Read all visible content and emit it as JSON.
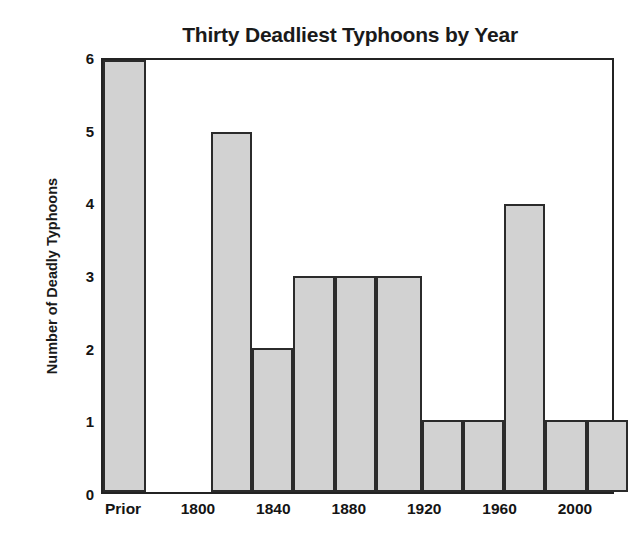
{
  "chart_data": {
    "type": "bar",
    "title": "Thirty Deadliest Typhoons by Year",
    "xlabel": "",
    "ylabel": "Number of Deadly Typhoons",
    "categories": [
      "Prior",
      "1800",
      "1820",
      "1840",
      "1860",
      "1880",
      "1900",
      "1920",
      "1940",
      "1960",
      "1980",
      "2000"
    ],
    "values": [
      6,
      0,
      5,
      2,
      3,
      3,
      3,
      1,
      1,
      4,
      1,
      1
    ],
    "ylim": [
      0,
      6
    ],
    "yticks": [
      "0",
      "1",
      "2",
      "3",
      "4",
      "5",
      "6"
    ],
    "xticks": [
      "Prior",
      "1800",
      "1840",
      "1880",
      "1920",
      "1960",
      "2000"
    ],
    "grid": false,
    "legend": "none",
    "bar_fill_color": "#d2d2d2",
    "bar_edge_color": "#2b2b2b",
    "axis_color": "#232323",
    "text_color": "#141414",
    "background_color": "#ffffff"
  },
  "axes": {
    "y_ticks": [
      {
        "label": "6",
        "value": 6
      },
      {
        "label": "5",
        "value": 5
      },
      {
        "label": "4",
        "value": 4
      },
      {
        "label": "3",
        "value": 3
      },
      {
        "label": "2",
        "value": 2
      },
      {
        "label": "1",
        "value": 1
      },
      {
        "label": "0",
        "value": 0
      }
    ],
    "x_ticks": [
      {
        "label": "Prior",
        "center_pct": 4.3
      },
      {
        "label": "1800",
        "center_pct": 18.9
      },
      {
        "label": "1840",
        "center_pct": 33.6
      },
      {
        "label": "1880",
        "center_pct": 48.3
      },
      {
        "label": "1920",
        "center_pct": 63.0
      },
      {
        "label": "1960",
        "center_pct": 77.7
      },
      {
        "label": "2000",
        "center_pct": 92.4
      }
    ]
  },
  "bars": [
    {
      "label": "Prior",
      "value": 6,
      "left_pct": 0.0,
      "width_pct": 8.4
    },
    {
      "label": "1800",
      "value": 0,
      "left_pct": 8.4,
      "width_pct": 13.0
    },
    {
      "label": "1820",
      "value": 5,
      "left_pct": 21.4,
      "width_pct": 8.1
    },
    {
      "label": "1840",
      "value": 2,
      "left_pct": 29.5,
      "width_pct": 8.1
    },
    {
      "label": "1860",
      "value": 3,
      "left_pct": 37.6,
      "width_pct": 8.1
    },
    {
      "label": "1880",
      "value": 3,
      "left_pct": 45.7,
      "width_pct": 8.1
    },
    {
      "label": "1900",
      "value": 3,
      "left_pct": 53.8,
      "width_pct": 9.0
    },
    {
      "label": "1920",
      "value": 1,
      "left_pct": 62.8,
      "width_pct": 8.1
    },
    {
      "label": "1940",
      "value": 1,
      "left_pct": 70.9,
      "width_pct": 8.1
    },
    {
      "label": "1960",
      "value": 4,
      "left_pct": 79.0,
      "width_pct": 8.1
    },
    {
      "label": "1980",
      "value": 1,
      "left_pct": 87.1,
      "width_pct": 8.1
    },
    {
      "label": "2000",
      "value": 1,
      "left_pct": 95.2,
      "width_pct": 8.1
    }
  ]
}
